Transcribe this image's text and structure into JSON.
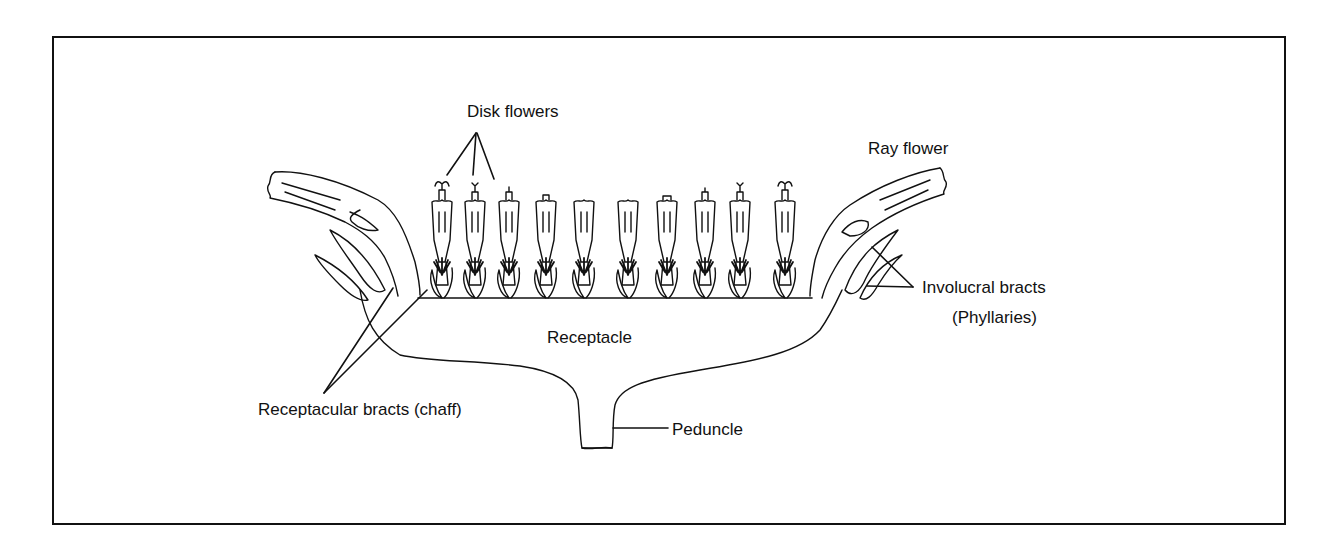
{
  "figure": {
    "type": "botanical-diagram",
    "colors": {
      "line": "#111111",
      "background": "#ffffff"
    }
  },
  "labels": {
    "disk_flowers": "Disk flowers",
    "ray_flower": "Ray flower",
    "receptacle": "Receptacle",
    "involucral_bracts": "Involucral bracts",
    "phyllaries": "(Phyllaries)",
    "receptacular_bracts": "Receptacular bracts (chaff)",
    "peduncle": "Peduncle"
  },
  "structure": {
    "disk_flower_count": 10,
    "ray_flower_count": 2
  }
}
